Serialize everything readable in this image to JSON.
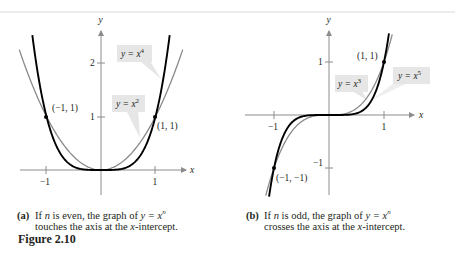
{
  "figure": {
    "title": "Figure 2.10"
  },
  "panels": [
    {
      "id": "a",
      "caption_tag": "(a)",
      "caption_line1_pre": "If ",
      "caption_var": "n",
      "caption_line1_mid": " is even, the graph of ",
      "caption_eq": "y = x",
      "caption_exp": "n",
      "caption_line2_pre": "touches the axis at the ",
      "caption_line2_var": "x",
      "caption_line2_post": "-intercept.",
      "axis_x_label": "x",
      "axis_y_label": "y",
      "x_ticks": [
        "−1",
        "1"
      ],
      "y_ticks": [
        "1",
        "2"
      ],
      "point_labels": [
        "(−1, 1)",
        "(1, 1)"
      ],
      "curve_labels": [
        {
          "text": "y = x",
          "exp": "4"
        },
        {
          "text": "y = x",
          "exp": "2"
        }
      ]
    },
    {
      "id": "b",
      "caption_tag": "(b)",
      "caption_line1_pre": "If ",
      "caption_var": "n",
      "caption_line1_mid": " is odd, the graph of ",
      "caption_eq": "y = x",
      "caption_exp": "n",
      "caption_line2_pre": "crosses the axis at the ",
      "caption_line2_var": "x",
      "caption_line2_post": "-intercept.",
      "axis_x_label": "x",
      "axis_y_label": "y",
      "x_ticks": [
        "−1",
        "1"
      ],
      "y_ticks": [
        "1",
        "−1"
      ],
      "point_labels": [
        "(1, 1)",
        "(−1, −1)"
      ],
      "curve_labels": [
        {
          "text": "y = x",
          "exp": "3"
        },
        {
          "text": "y = x",
          "exp": "5"
        }
      ]
    }
  ],
  "chart_data": [
    {
      "type": "line",
      "title": "(a) If n is even, the graph of y = x^n touches the axis at the x-intercept.",
      "xlabel": "x",
      "ylabel": "y",
      "xlim": [
        -1.5,
        1.5
      ],
      "ylim": [
        -0.45,
        2.6
      ],
      "x_ticks": [
        -1,
        1
      ],
      "y_ticks": [
        1,
        2
      ],
      "grid": false,
      "series": [
        {
          "name": "y = x^2",
          "function": "x^2",
          "color": "#8a8a8a",
          "x_range": [
            -1.5,
            1.5
          ]
        },
        {
          "name": "y = x^4",
          "function": "x^4",
          "color": "#000000",
          "x_range": [
            -1.26,
            1.26
          ]
        }
      ],
      "points": [
        {
          "x": -1,
          "y": 1,
          "label": "(−1, 1)"
        },
        {
          "x": 1,
          "y": 1,
          "label": "(1, 1)"
        }
      ]
    },
    {
      "type": "line",
      "title": "(b) If n is odd, the graph of y = x^n crosses the axis at the x-intercept.",
      "xlabel": "x",
      "ylabel": "y",
      "xlim": [
        -1.5,
        1.6
      ],
      "ylim": [
        -1.5,
        1.6
      ],
      "x_ticks": [
        -1,
        1
      ],
      "y_ticks": [
        -1,
        1
      ],
      "grid": false,
      "series": [
        {
          "name": "y = x^3",
          "function": "x^3",
          "color": "#8a8a8a",
          "x_range": [
            -1.15,
            1.15
          ]
        },
        {
          "name": "y = x^5",
          "function": "x^5",
          "color": "#000000",
          "x_range": [
            -1.09,
            1.09
          ]
        }
      ],
      "points": [
        {
          "x": 1,
          "y": 1,
          "label": "(1, 1)"
        },
        {
          "x": -1,
          "y": -1,
          "label": "(−1, −1)"
        }
      ]
    }
  ],
  "colors": {
    "curve_dark": "#000000",
    "curve_light": "#8a8a8a",
    "axis": "#8c8c8c",
    "label_box": "#e6e6e6",
    "text": "#231f20"
  }
}
